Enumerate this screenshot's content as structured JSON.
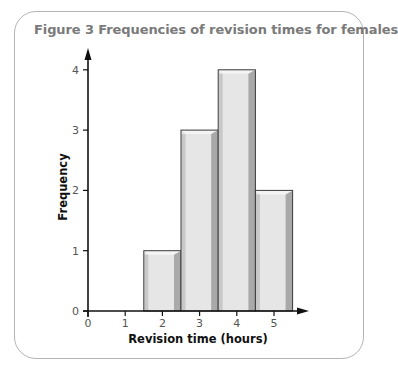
{
  "figure": {
    "title": "Figure 3  Frequencies of revision times for females"
  },
  "chart_data": {
    "type": "bar",
    "title": "Figure 3  Frequencies of revision times for females",
    "xlabel": "Revision time (hours)",
    "ylabel": "Frequency",
    "categories": [
      "2",
      "3",
      "4",
      "5"
    ],
    "values": [
      1,
      3,
      4,
      2
    ],
    "bins": [
      {
        "center": 2,
        "from": 1.5,
        "to": 2.5,
        "frequency": 1
      },
      {
        "center": 3,
        "from": 2.5,
        "to": 3.5,
        "frequency": 3
      },
      {
        "center": 4,
        "from": 3.5,
        "to": 4.5,
        "frequency": 4
      },
      {
        "center": 5,
        "from": 4.5,
        "to": 5.5,
        "frequency": 2
      }
    ],
    "xticks": [
      "0",
      "1",
      "2",
      "3",
      "4",
      "5"
    ],
    "yticks": [
      "0",
      "1",
      "2",
      "3",
      "4"
    ],
    "xlim": [
      0,
      5.5
    ],
    "ylim": [
      0,
      4.3
    ],
    "grid": false,
    "legend": null,
    "colors": {
      "bar_face": "#e6e6e6",
      "bar_side_dark": "#a9a9a9",
      "bar_side_light": "#c8c8c8",
      "bar_outline": "#3a3a3a",
      "axis": "#111111",
      "title": "#7a7a7a",
      "frame": "#b4b4b4"
    }
  }
}
